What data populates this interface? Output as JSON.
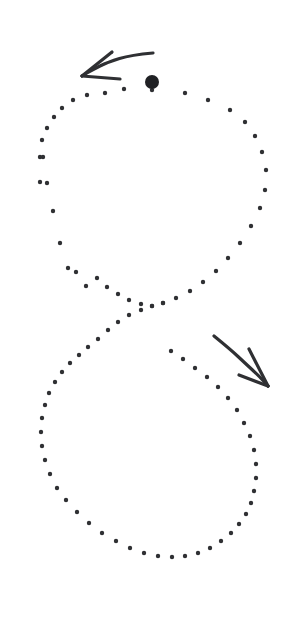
{
  "canvas": {
    "width": 299,
    "height": 618,
    "background_color": "#ffffff"
  },
  "figure": {
    "name": "dotted-figure-eight-trajectory",
    "dot_color": "#2f3033",
    "dot_radius": 2.2,
    "marker_color": "#202124",
    "arrow_color": "#2f3033",
    "arrow_stroke_width": 3.2
  },
  "chart_data": {
    "type": "scatter",
    "title": "",
    "subtitle": "",
    "xlabel": "",
    "ylabel": "",
    "xlim": [
      0,
      299
    ],
    "ylim": [
      0,
      618
    ],
    "grid": false,
    "legend": null,
    "annotations": [
      {
        "name": "direction-arrow-top",
        "text": "",
        "points": [
          [
            153,
            53
          ],
          [
            131,
            55
          ],
          [
            108,
            62
          ],
          [
            92,
            70
          ],
          [
            82,
            76
          ]
        ],
        "barbs": [
          [
            [
              82,
              76
            ],
            [
              112,
              52
            ]
          ],
          [
            [
              82,
              76
            ],
            [
              120,
              79
            ]
          ]
        ],
        "direction": "left"
      },
      {
        "name": "direction-arrow-bottom",
        "text": "",
        "points": [
          [
            214,
            336
          ],
          [
            230,
            349
          ],
          [
            246,
            364
          ],
          [
            259,
            376
          ],
          [
            268,
            386
          ]
        ],
        "barbs": [
          [
            [
              268,
              386
            ],
            [
              249,
              349
            ]
          ],
          [
            [
              268,
              386
            ],
            [
              239,
              375
            ]
          ]
        ],
        "direction": "down-right"
      }
    ],
    "series": [
      {
        "name": "start-marker",
        "marker": "large-filled-circle",
        "radius": 7,
        "x": [
          152
        ],
        "y": [
          82
        ]
      },
      {
        "name": "upper-loop-dots",
        "marker": "small-filled-circle",
        "x": [
          152,
          185,
          208,
          230,
          245,
          255,
          262,
          266,
          265,
          260,
          251,
          240,
          228,
          216,
          203,
          190,
          176,
          163,
          152,
          141,
          129,
          118,
          107,
          97,
          86,
          76,
          68,
          60,
          53,
          47,
          43,
          40,
          40,
          42,
          47,
          54,
          62,
          73,
          87,
          105,
          124
        ],
        "y": [
          90,
          93,
          100,
          110,
          122,
          136,
          152,
          170,
          190,
          208,
          226,
          243,
          258,
          271,
          282,
          291,
          298,
          303,
          306,
          304,
          300,
          294,
          287,
          278,
          286,
          272,
          268,
          243,
          211,
          183,
          157,
          182,
          157,
          140,
          128,
          117,
          108,
          100,
          95,
          93,
          89
        ]
      },
      {
        "name": "lower-loop-dots",
        "marker": "small-filled-circle",
        "x": [
          163,
          152,
          141,
          129,
          118,
          108,
          98,
          88,
          79,
          70,
          62,
          55,
          49,
          45,
          42,
          41,
          42,
          45,
          50,
          57,
          66,
          77,
          89,
          102,
          116,
          130,
          144,
          158,
          172,
          185,
          198,
          210,
          221,
          231,
          239,
          246,
          251,
          254,
          256,
          256,
          254,
          250,
          244,
          237,
          228,
          218,
          207,
          195,
          183,
          171
        ],
        "y": [
          303,
          306,
          310,
          315,
          322,
          330,
          339,
          347,
          355,
          363,
          372,
          382,
          393,
          405,
          418,
          432,
          446,
          460,
          474,
          488,
          500,
          512,
          523,
          533,
          541,
          548,
          553,
          556,
          557,
          556,
          553,
          548,
          541,
          533,
          524,
          514,
          503,
          491,
          478,
          464,
          450,
          436,
          423,
          410,
          398,
          387,
          377,
          368,
          359,
          351
        ]
      }
    ]
  }
}
